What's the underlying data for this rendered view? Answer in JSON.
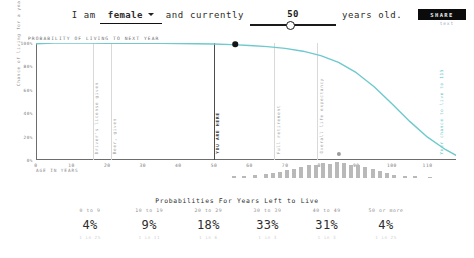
{
  "header": {
    "prefix": "I am",
    "gender_value": "female",
    "middle": "and currently",
    "age_value": "50",
    "suffix": "years old.",
    "share_label": "SHARE",
    "share_sub": "text"
  },
  "chart": {
    "title": "PROBABILITY OF LIVING TO NEXT YEAR",
    "ylabel": "Chance of living for a year",
    "xlabel": "AGE IN YEARS",
    "yticks": [
      "100%",
      "80%",
      "60%",
      "40%",
      "20%",
      "0%"
    ],
    "xticks": [
      "0",
      "10",
      "20",
      "30",
      "40",
      "50",
      "60",
      "70",
      "80",
      "90",
      "100",
      "110"
    ],
    "annotations": [
      {
        "label": "Driver's license given",
        "age": 16
      },
      {
        "label": "Beer, given",
        "age": 21
      },
      {
        "label": "YOU ARE HERE",
        "age": 50
      },
      {
        "label": "Full retirement",
        "age": 67
      },
      {
        "label": "Overall life expectancy",
        "age": 79
      },
      {
        "label": "Your chance to live to 115",
        "age": 115
      }
    ],
    "markers": [
      {
        "name": "current-age-marker",
        "age": 56,
        "probability": 99
      },
      {
        "name": "secondary-marker",
        "age": 85,
        "probability": 5
      }
    ]
  },
  "chart_data": {
    "type": "line",
    "title": "PROBABILITY OF LIVING TO NEXT YEAR",
    "xlabel": "AGE IN YEARS",
    "ylabel": "Chance of living for a year",
    "xlim": [
      0,
      118
    ],
    "ylim": [
      0,
      100
    ],
    "grid": false,
    "legend": null,
    "line_color": "#6fc9cd",
    "x": [
      0,
      5,
      10,
      15,
      20,
      25,
      30,
      35,
      40,
      45,
      50,
      55,
      60,
      65,
      70,
      75,
      80,
      85,
      90,
      95,
      100,
      105,
      110,
      115,
      118
    ],
    "y": [
      99.4,
      99.9,
      99.9,
      99.9,
      99.8,
      99.8,
      99.8,
      99.7,
      99.6,
      99.4,
      99.1,
      98.6,
      97.9,
      96.9,
      95.4,
      93.0,
      89.2,
      83.4,
      74.6,
      62.6,
      48.0,
      33.0,
      19.5,
      9.0,
      4.0
    ],
    "histogram": {
      "name": "deaths-by-age",
      "color": "#b9b9b9",
      "x": [
        55,
        58,
        61,
        64,
        66,
        68,
        70,
        72,
        74,
        76,
        78,
        80,
        82,
        84,
        86,
        88,
        90,
        92,
        94,
        96,
        98,
        100,
        103,
        106,
        110
      ],
      "values": [
        2,
        3,
        4,
        5,
        6,
        7,
        9,
        11,
        13,
        15,
        16,
        18,
        17,
        19,
        18,
        16,
        15,
        13,
        11,
        8,
        6,
        4,
        3,
        2,
        1
      ]
    }
  },
  "probabilities": {
    "title": "Probabilities For Years Left to Live",
    "rows": [
      {
        "range": "0 to 9",
        "value": "4%",
        "sub": "1 in 25"
      },
      {
        "range": "10 to 19",
        "value": "9%",
        "sub": "1 in 11"
      },
      {
        "range": "20 to 29",
        "value": "18%",
        "sub": "1 in 6"
      },
      {
        "range": "30 to 39",
        "value": "33%",
        "sub": "1 in 3"
      },
      {
        "range": "40 to 49",
        "value": "31%",
        "sub": "1 in 3"
      },
      {
        "range": "50 or more",
        "value": "4%",
        "sub": "1 in 25"
      }
    ]
  },
  "colors": {
    "accent": "#6fc9cd",
    "ink": "#2c2c2c",
    "muted": "#9c9c9c"
  }
}
